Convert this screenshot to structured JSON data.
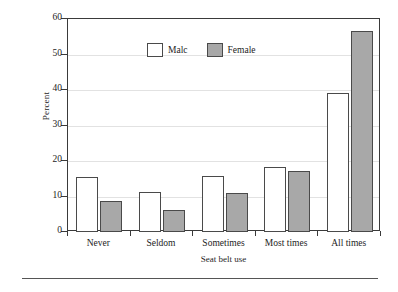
{
  "chart_data": {
    "type": "bar",
    "title": "",
    "subtitle": "",
    "xlabel": "Seat belt use",
    "ylabel": "Percent",
    "categories": [
      "Never",
      "Seldom",
      "Sometimes",
      "Most times",
      "All times"
    ],
    "series": [
      {
        "name": "Malc",
        "color": "#ffffff",
        "values": [
          15.5,
          11.2,
          15.8,
          18.4,
          39.2
        ]
      },
      {
        "name": "Female",
        "color": "#a8a8a8",
        "values": [
          8.8,
          6.2,
          11.0,
          17.2,
          56.6
        ]
      }
    ],
    "ylim": [
      0,
      60
    ],
    "yticks": [
      0,
      10,
      20,
      30,
      40,
      50,
      60
    ],
    "ytick_labels": [
      "0",
      "10",
      "20",
      "30",
      "40",
      "50",
      "60"
    ],
    "grid": true,
    "grid_axis": "y",
    "legend_position": "top-left",
    "frame": true
  },
  "axes": {
    "y_title": "Percent",
    "x_title": "Seat belt use"
  },
  "legend": {
    "entries": [
      {
        "label": "Malc",
        "swatch": "male-swatch"
      },
      {
        "label": "Female",
        "swatch": "female-swatch"
      }
    ]
  },
  "colors": {
    "male_fill": "#ffffff",
    "female_fill": "#a8a8a8",
    "bar_outline": "#4a4a4a",
    "frame": "#3a3a3a",
    "gridline": "#e2e2e2",
    "rule": "#555555"
  }
}
